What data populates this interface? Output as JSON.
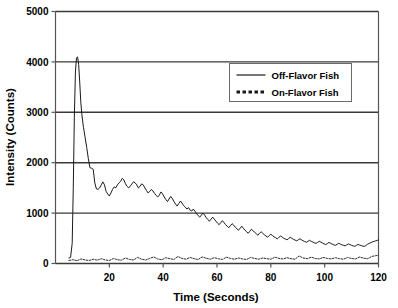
{
  "chart_data": {
    "type": "line",
    "title": "",
    "xlabel": "Time (Seconds)",
    "ylabel": "Intensity (Counts)",
    "xlim": [
      0,
      120
    ],
    "ylim": [
      0,
      5000
    ],
    "xticks": [
      20,
      40,
      60,
      80,
      100,
      120
    ],
    "yticks": [
      0,
      1000,
      2000,
      3000,
      4000,
      5000
    ],
    "xtick_labels": [
      "20",
      "40",
      "60",
      "80",
      "100",
      "120"
    ],
    "ytick_labels": [
      "0",
      "1000",
      "2000",
      "3000",
      "4000",
      "5000"
    ],
    "grid": "horizontal",
    "legend_position": "upper-right-inside",
    "series": [
      {
        "name": "Off-Flavor Fish",
        "style": "solid",
        "color": "#1a1a1a",
        "x": [
          5.0,
          5.6,
          6.2,
          6.6,
          7.0,
          7.4,
          7.8,
          8.2,
          8.6,
          9.0,
          9.4,
          9.8,
          10.4,
          11.0,
          11.6,
          12.2,
          12.8,
          13.4,
          14.0,
          14.6,
          15.2,
          15.8,
          16.4,
          17.0,
          17.6,
          18.2,
          18.8,
          19.4,
          20.0,
          20.6,
          21.2,
          21.8,
          22.4,
          23.0,
          23.6,
          24.2,
          24.8,
          25.4,
          26.0,
          26.6,
          27.2,
          27.8,
          28.4,
          29.0,
          29.6,
          30.2,
          30.8,
          31.4,
          32.0,
          32.6,
          33.2,
          33.8,
          34.4,
          35.0,
          35.6,
          36.2,
          36.8,
          37.4,
          38.0,
          38.6,
          39.2,
          39.8,
          40.4,
          41.0,
          41.6,
          42.2,
          42.8,
          43.4,
          44.0,
          44.6,
          45.2,
          45.8,
          46.4,
          47.0,
          47.6,
          48.2,
          48.8,
          49.4,
          50.0,
          50.6,
          51.2,
          51.8,
          52.4,
          53.0,
          53.6,
          54.2,
          54.8,
          55.4,
          56.0,
          56.6,
          57.2,
          57.8,
          58.4,
          59.0,
          59.6,
          60.2,
          60.8,
          61.4,
          62.0,
          62.6,
          63.2,
          63.8,
          64.4,
          65.0,
          65.6,
          66.2,
          66.8,
          67.4,
          68.0,
          68.6,
          69.2,
          69.8,
          70.4,
          71.0,
          71.6,
          72.2,
          72.8,
          73.4,
          74.0,
          74.6,
          75.2,
          75.8,
          76.4,
          77.0,
          77.6,
          78.2,
          78.8,
          79.4,
          80.0,
          80.6,
          81.2,
          81.8,
          82.4,
          83.0,
          83.6,
          84.2,
          84.8,
          85.4,
          86.0,
          86.6,
          87.2,
          87.8,
          88.4,
          89.0,
          89.6,
          90.2,
          90.8,
          91.4,
          92.0,
          92.6,
          93.2,
          93.8,
          94.4,
          95.0,
          95.6,
          96.2,
          96.8,
          97.4,
          98.0,
          98.6,
          99.2,
          99.8,
          100.4,
          101.0,
          101.6,
          102.2,
          102.8,
          103.4,
          104.0,
          104.6,
          105.2,
          105.8,
          106.4,
          107.0,
          107.6,
          108.2,
          108.8,
          109.4,
          110.0,
          110.6,
          111.2,
          111.8,
          112.4,
          113.0,
          113.6,
          114.2,
          114.8,
          115.4,
          116.0,
          116.6,
          117.2,
          117.8,
          118.4,
          119.0,
          119.6,
          120.0
        ],
        "y": [
          110,
          120,
          400,
          1500,
          2900,
          3800,
          4080,
          4100,
          3950,
          3600,
          3200,
          2950,
          2700,
          2500,
          2300,
          2080,
          1900,
          1890,
          1870,
          1600,
          1480,
          1470,
          1500,
          1560,
          1620,
          1560,
          1430,
          1380,
          1340,
          1400,
          1470,
          1520,
          1500,
          1560,
          1600,
          1630,
          1690,
          1660,
          1580,
          1530,
          1500,
          1540,
          1580,
          1620,
          1600,
          1560,
          1500,
          1530,
          1580,
          1560,
          1500,
          1450,
          1400,
          1430,
          1470,
          1440,
          1390,
          1350,
          1320,
          1360,
          1420,
          1380,
          1320,
          1270,
          1230,
          1280,
          1330,
          1290,
          1230,
          1180,
          1140,
          1190,
          1240,
          1200,
          1150,
          1120,
          1080,
          1110,
          1060,
          1040,
          1080,
          1040,
          990,
          950,
          920,
          960,
          1000,
          960,
          910,
          870,
          840,
          880,
          920,
          880,
          840,
          800,
          770,
          810,
          850,
          810,
          770,
          740,
          710,
          750,
          790,
          760,
          720,
          690,
          660,
          700,
          740,
          700,
          660,
          630,
          600,
          640,
          680,
          650,
          620,
          590,
          560,
          600,
          630,
          600,
          570,
          545,
          520,
          555,
          580,
          555,
          530,
          510,
          490,
          520,
          545,
          525,
          500,
          485,
          470,
          495,
          520,
          500,
          480,
          465,
          450,
          470,
          490,
          470,
          450,
          435,
          420,
          440,
          460,
          440,
          425,
          410,
          400,
          420,
          440,
          425,
          405,
          390,
          375,
          395,
          420,
          400,
          385,
          370,
          360,
          380,
          400,
          385,
          370,
          360,
          350,
          370,
          390,
          375,
          360,
          350,
          340,
          360,
          380,
          365,
          355,
          345,
          340,
          360,
          385,
          400,
          415,
          430,
          440,
          450,
          460,
          465
        ]
      },
      {
        "name": "On-Flavor Fish",
        "style": "dotted",
        "color": "#2a2a2a",
        "x": [
          5.0,
          6.5,
          8.0,
          9.5,
          11.0,
          12.5,
          14.0,
          15.5,
          17.0,
          18.5,
          20.0,
          21.5,
          23.0,
          24.5,
          26.0,
          27.5,
          29.0,
          30.5,
          32.0,
          33.5,
          35.0,
          36.5,
          38.0,
          39.5,
          41.0,
          42.5,
          44.0,
          45.5,
          47.0,
          48.5,
          50.0,
          51.5,
          53.0,
          54.5,
          56.0,
          57.5,
          59.0,
          60.5,
          62.0,
          63.5,
          65.0,
          66.5,
          68.0,
          69.5,
          71.0,
          72.5,
          74.0,
          75.5,
          77.0,
          78.5,
          80.0,
          81.5,
          83.0,
          84.5,
          86.0,
          87.5,
          89.0,
          90.5,
          92.0,
          93.5,
          95.0,
          96.5,
          98.0,
          99.5,
          101.0,
          102.5,
          104.0,
          105.5,
          107.0,
          108.5,
          110.0,
          111.5,
          113.0,
          114.5,
          116.0,
          117.5,
          119.0,
          120.0
        ],
        "y": [
          60,
          75,
          55,
          90,
          70,
          60,
          85,
          65,
          95,
          70,
          60,
          100,
          75,
          65,
          110,
          80,
          70,
          120,
          85,
          70,
          100,
          130,
          90,
          75,
          115,
          95,
          80,
          140,
          100,
          85,
          120,
          95,
          80,
          130,
          105,
          85,
          115,
          95,
          80,
          125,
          100,
          85,
          110,
          90,
          80,
          120,
          100,
          85,
          110,
          95,
          85,
          125,
          100,
          90,
          115,
          95,
          85,
          150,
          110,
          95,
          125,
          100,
          90,
          120,
          100,
          90,
          115,
          95,
          85,
          120,
          100,
          90,
          130,
          105,
          95,
          140,
          155,
          165
        ]
      }
    ]
  },
  "legend": {
    "entries": [
      {
        "label": "Off-Flavor Fish",
        "style": "solid"
      },
      {
        "label": "On-Flavor Fish",
        "style": "dotted"
      }
    ]
  }
}
